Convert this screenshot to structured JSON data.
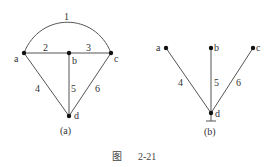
{
  "figure": {
    "caption_prefix": "图",
    "caption_number": "2-21"
  },
  "graph_a": {
    "label": "(a)",
    "nodes": [
      {
        "id": "a",
        "label": "a"
      },
      {
        "id": "b",
        "label": "b"
      },
      {
        "id": "c",
        "label": "c"
      },
      {
        "id": "d",
        "label": "d"
      }
    ],
    "edges": [
      {
        "id": "1",
        "label": "1",
        "from": "a",
        "to": "c",
        "shape": "arc"
      },
      {
        "id": "2",
        "label": "2",
        "from": "a",
        "to": "b"
      },
      {
        "id": "3",
        "label": "3",
        "from": "b",
        "to": "c"
      },
      {
        "id": "4",
        "label": "4",
        "from": "a",
        "to": "d"
      },
      {
        "id": "5",
        "label": "5",
        "from": "b",
        "to": "d"
      },
      {
        "id": "6",
        "label": "6",
        "from": "c",
        "to": "d"
      }
    ]
  },
  "graph_b": {
    "label": "(b)",
    "nodes": [
      {
        "id": "a",
        "label": "a"
      },
      {
        "id": "b",
        "label": "b"
      },
      {
        "id": "c",
        "label": "c"
      },
      {
        "id": "d",
        "label": "d",
        "reference": true
      }
    ],
    "edges": [
      {
        "id": "4",
        "label": "4",
        "from": "a",
        "to": "d"
      },
      {
        "id": "5",
        "label": "5",
        "from": "b",
        "to": "d"
      },
      {
        "id": "6",
        "label": "6",
        "from": "c",
        "to": "d"
      }
    ]
  }
}
